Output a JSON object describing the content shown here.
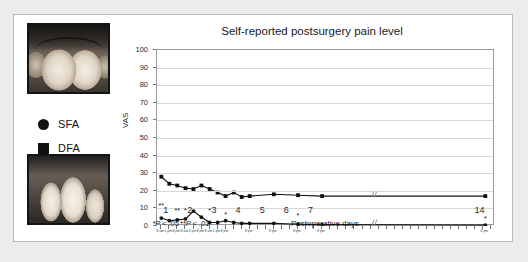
{
  "figure": {
    "photos": [
      {
        "name": "preoperative-clinical-photo",
        "caption": ""
      },
      {
        "name": "postoperative-clinical-photo",
        "caption": ""
      }
    ]
  },
  "legend": {
    "items": [
      {
        "marker": "circle-marker",
        "label": "SFA"
      },
      {
        "marker": "square-marker",
        "label": "DFA"
      }
    ]
  },
  "footnotes": [
    {
      "text": "*P < .05",
      "x": 1.0
    },
    {
      "text": "**P < .01",
      "x": 2.2
    }
  ],
  "chart_data": {
    "type": "line",
    "title": "Self-reported postsurgery pain level",
    "xlabel": "Postoperative days",
    "ylabel": "VAS",
    "ylim": [
      0,
      100
    ],
    "yticks": [
      0,
      10,
      20,
      30,
      40,
      50,
      60,
      70,
      80,
      90,
      100
    ],
    "xlim": [
      0.6,
      14.6
    ],
    "grid": true,
    "legend_position": "outside-left",
    "day_ticks": [
      {
        "value": 1,
        "label": "1"
      },
      {
        "value": 2,
        "label": "2"
      },
      {
        "value": 3,
        "label": "3"
      },
      {
        "value": 4,
        "label": "4"
      },
      {
        "value": 5,
        "label": "5"
      },
      {
        "value": 6,
        "label": "6"
      },
      {
        "value": 7,
        "label": "7"
      },
      {
        "value": 14,
        "label": "14"
      }
    ],
    "minor_tick_labels": [
      {
        "x": 0.78,
        "label": "8 am"
      },
      {
        "x": 1.11,
        "label": "1 pm"
      },
      {
        "x": 1.44,
        "label": "8 pm"
      },
      {
        "x": 1.78,
        "label": "8 am"
      },
      {
        "x": 2.11,
        "label": "1 pm"
      },
      {
        "x": 2.44,
        "label": "8 pm"
      },
      {
        "x": 2.78,
        "label": "8 am"
      },
      {
        "x": 3.11,
        "label": "1 pm"
      },
      {
        "x": 3.44,
        "label": "8 pm"
      },
      {
        "x": 4.44,
        "label": "8 pm"
      },
      {
        "x": 5.44,
        "label": "8 pm"
      },
      {
        "x": 6.44,
        "label": "8 pm"
      },
      {
        "x": 7.44,
        "label": "8 pm"
      },
      {
        "x": 14.2,
        "label": "8 pm"
      }
    ],
    "axis_break": {
      "x": 9.5,
      "label": "//"
    },
    "series": [
      {
        "name": "DFA",
        "marker": "square",
        "color": "#111111",
        "points": [
          {
            "x": 0.78,
            "y": 28
          },
          {
            "x": 1.11,
            "y": 24
          },
          {
            "x": 1.44,
            "y": 23
          },
          {
            "x": 1.78,
            "y": 21.5
          },
          {
            "x": 2.11,
            "y": 21
          },
          {
            "x": 2.44,
            "y": 23
          },
          {
            "x": 2.78,
            "y": 21
          },
          {
            "x": 3.11,
            "y": 19
          },
          {
            "x": 3.44,
            "y": 17
          },
          {
            "x": 3.78,
            "y": 19
          },
          {
            "x": 4.11,
            "y": 16.5
          },
          {
            "x": 4.44,
            "y": 17
          },
          {
            "x": 5.44,
            "y": 18
          },
          {
            "x": 6.44,
            "y": 17.5
          },
          {
            "x": 7.44,
            "y": 17
          },
          {
            "x": 14.2,
            "y": 17
          }
        ]
      },
      {
        "name": "SFA",
        "marker": "circle",
        "color": "#111111",
        "points": [
          {
            "x": 0.78,
            "y": 4.5
          },
          {
            "x": 1.11,
            "y": 3
          },
          {
            "x": 1.44,
            "y": 3.5
          },
          {
            "x": 1.78,
            "y": 4
          },
          {
            "x": 2.11,
            "y": 8.5
          },
          {
            "x": 2.44,
            "y": 5
          },
          {
            "x": 2.78,
            "y": 2
          },
          {
            "x": 3.11,
            "y": 2
          },
          {
            "x": 3.44,
            "y": 3
          },
          {
            "x": 3.78,
            "y": 2
          },
          {
            "x": 4.11,
            "y": 1.5
          },
          {
            "x": 4.44,
            "y": 1.5
          },
          {
            "x": 5.44,
            "y": 1.5
          },
          {
            "x": 6.44,
            "y": 1
          },
          {
            "x": 7.44,
            "y": 0.8
          },
          {
            "x": 14.2,
            "y": 0.5
          }
        ]
      }
    ],
    "significance_marks": [
      {
        "x": 0.78,
        "y": 13.5,
        "label": "**"
      },
      {
        "x": 1.44,
        "y": 11,
        "label": "**"
      },
      {
        "x": 1.78,
        "y": 11,
        "label": "*"
      },
      {
        "x": 2.78,
        "y": 11,
        "label": "*"
      },
      {
        "x": 3.44,
        "y": 8.5,
        "label": "*"
      },
      {
        "x": 6.44,
        "y": 8,
        "label": "*"
      },
      {
        "x": 14.2,
        "y": 6,
        "label": "*"
      }
    ]
  }
}
